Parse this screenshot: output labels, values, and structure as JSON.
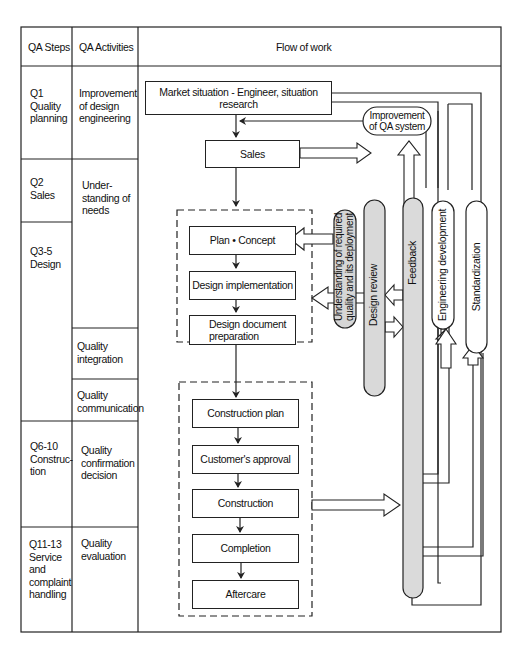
{
  "header": {
    "col1": "QA Steps",
    "col2": "QA Activities",
    "col3": "Flow of work"
  },
  "steps": [
    {
      "label": "Q1\nQuality\nplanning"
    },
    {
      "label": "Q2\nSales"
    },
    {
      "label": "Q3-5\nDesign"
    },
    {
      "label": "Q6-10\nConstruc-\ntion"
    },
    {
      "label": "Q11-13\nService\nand\ncomplaint\nhandling"
    }
  ],
  "activities": [
    {
      "label": "Improvement\nof design\nengineering"
    },
    {
      "label": "Under-\nstanding of\nneeds"
    },
    {
      "label": "Quality\nintegration"
    },
    {
      "label": "Quality\ncommunication"
    },
    {
      "label": "Quality\nconfirmation\ndecision"
    },
    {
      "label": "Quality\nevaluation"
    }
  ],
  "flow": {
    "market": "Market situation - Engineer, situation research",
    "sales": "Sales",
    "plan_concept": "Plan • Concept",
    "design_implementation": "Design implementation",
    "design_document": "Design document\npreparation",
    "construction_plan": "Construction plan",
    "customer_approval": "Customer's approval",
    "construction": "Construction",
    "completion": "Completion",
    "aftercare": "Aftercare"
  },
  "side": {
    "improvement_qa": "Improvement\nof QA system",
    "understanding": "Understanding of required\nquality and its deployment",
    "design_review": "Design review",
    "feedback": "Feedback",
    "engineering_development": "Engineering development",
    "standardization": "Standardization"
  },
  "colors": {
    "line": "#222222",
    "gray_fill": "#d9d9d9",
    "background": "#ffffff"
  }
}
